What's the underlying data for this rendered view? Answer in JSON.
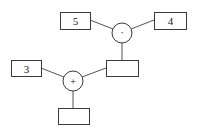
{
  "diagram": {
    "type": "expression-tree",
    "inputs": {
      "left_top": "5",
      "right_top": "4",
      "left_bottom": "3"
    },
    "operators": {
      "multiply": "·",
      "add": "+"
    },
    "outputs": {
      "product_result": "",
      "sum_result": ""
    },
    "colors": {
      "stroke": "#3a3a3a",
      "background": "#ffffff"
    }
  }
}
